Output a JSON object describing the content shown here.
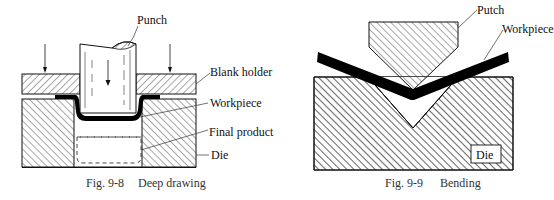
{
  "figures": [
    {
      "id": "fig-9-8",
      "caption_number": "Fig. 9-8",
      "caption_title": "Deep drawing",
      "labels": {
        "punch": "Punch",
        "blank_holder": "Blank holder",
        "workpiece": "Workpiece",
        "final_product": "Final product",
        "die": "Die"
      }
    },
    {
      "id": "fig-9-9",
      "caption_number": "Fig. 9-9",
      "caption_title": "Bending",
      "labels": {
        "punch": "Putch",
        "workpiece": "Workpiece",
        "die": "Die"
      }
    }
  ],
  "colors": {
    "line": "#111111",
    "workpiece": "#000000",
    "caption": "#333333"
  }
}
